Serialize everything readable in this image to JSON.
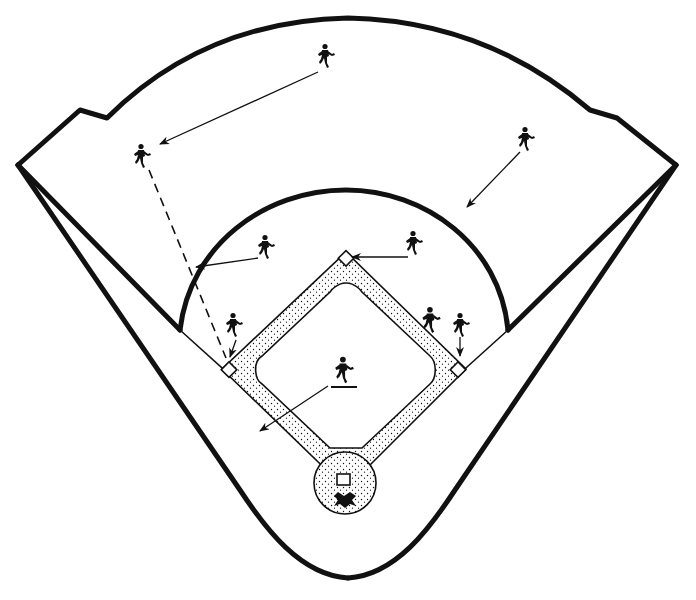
{
  "diagram": {
    "title": "",
    "colors": {
      "ink": "#111111",
      "paper": "#ffffff",
      "dirt_dots": "#111111"
    },
    "field": {
      "home_plate": [
        344,
        480
      ],
      "first_base": [
        458,
        369
      ],
      "second_base": [
        346,
        259
      ],
      "third_base": [
        229,
        369
      ],
      "pitchers_mound": [
        344,
        480
      ]
    },
    "players": [
      {
        "id": "center-fielder",
        "x": 326,
        "y": 57
      },
      {
        "id": "left-fielder",
        "x": 142,
        "y": 156
      },
      {
        "id": "right-fielder",
        "x": 526,
        "y": 138
      },
      {
        "id": "shortstop",
        "x": 266,
        "y": 246
      },
      {
        "id": "second-baseman",
        "x": 414,
        "y": 243
      },
      {
        "id": "third-baseman",
        "x": 234,
        "y": 325
      },
      {
        "id": "first-baseman-fielding",
        "x": 430,
        "y": 320
      },
      {
        "id": "first-baseman",
        "x": 461,
        "y": 327
      },
      {
        "id": "pitcher",
        "x": 344,
        "y": 370
      },
      {
        "id": "catcher",
        "x": 347,
        "y": 500
      }
    ],
    "movements": [
      {
        "from": "center-fielder",
        "to": [
          158,
          145
        ],
        "style": "solid"
      },
      {
        "from": "right-fielder",
        "to": [
          466,
          208
        ],
        "style": "solid"
      },
      {
        "from": "shortstop",
        "to": [
          194,
          268
        ],
        "style": "solid"
      },
      {
        "from": "second-baseman",
        "to": [
          350,
          257
        ],
        "style": "solid"
      },
      {
        "from": "third-baseman",
        "to": [
          229,
          358
        ],
        "style": "solid"
      },
      {
        "from": "first-baseman",
        "to": [
          459,
          356
        ],
        "style": "solid"
      },
      {
        "from": "pitcher",
        "to": [
          258,
          432
        ],
        "style": "solid"
      },
      {
        "from": "left-fielder",
        "to": [
          228,
          360
        ],
        "style": "dashed"
      }
    ]
  }
}
